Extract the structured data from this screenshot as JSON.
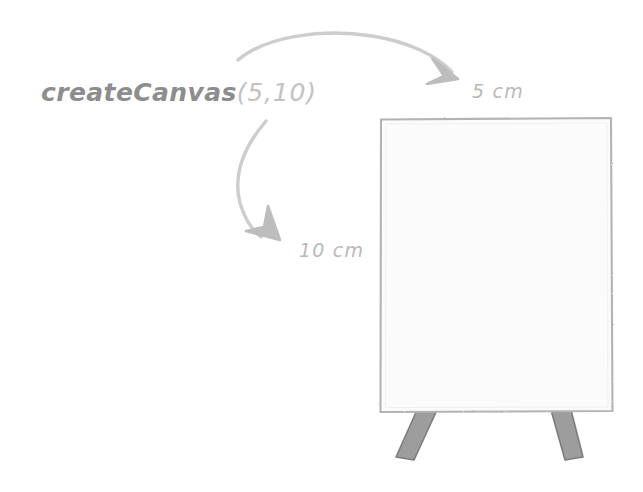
{
  "illustration": {
    "title": "createCanvas size diagram",
    "background_color": "#ffffff",
    "labels": {
      "code_function": "createCanvas",
      "code_args": "(5,10)",
      "width_label": "5 cm",
      "height_label": "10 cm"
    },
    "canvas_board": {
      "fill_color": "#fbfbfb",
      "border_color": "#b0b0b0",
      "x": 380,
      "y": 118,
      "width": 232,
      "height": 294
    },
    "easel_legs": {
      "color": "#9a9a9a",
      "border_color": "#7e7e7e",
      "count": 2
    },
    "arrows": {
      "stroke_color": "#c9c9c9",
      "head_color": "#bdbdbd",
      "width_arrow_name": "arrow-to-width-label",
      "height_arrow_name": "arrow-to-height-label"
    }
  }
}
